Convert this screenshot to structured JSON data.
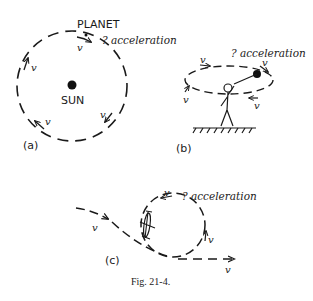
{
  "figure": {
    "caption": "Fig. 21-4.",
    "panels": {
      "a": {
        "label": "(a)",
        "planet_label": "PLANET",
        "center_label": "SUN",
        "acceleration_label": "? acceleration",
        "velocity_label": "v"
      },
      "b": {
        "label": "(b)",
        "acceleration_label": "? acceleration",
        "velocity_label": "v"
      },
      "c": {
        "label": "(c)",
        "acceleration_label": "? acceleration",
        "velocity_label": "v"
      }
    }
  }
}
